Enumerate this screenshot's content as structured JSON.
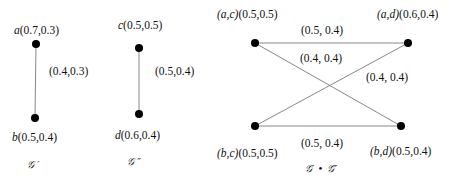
{
  "graphs": [
    {
      "caption": "𝒢 ′",
      "nodes": [
        {
          "id": "a",
          "name": "a",
          "value": "(0.7,0.3)",
          "x": 36,
          "y": 44
        },
        {
          "id": "b",
          "name": "b",
          "value": "(0.5,0.4)",
          "x": 35,
          "y": 118
        }
      ],
      "edges": [
        {
          "from": "a",
          "to": "b",
          "value": "(0.4,0.3)"
        }
      ]
    },
    {
      "caption": "𝒢 ″",
      "nodes": [
        {
          "id": "c",
          "name": "c",
          "value": "(0.5,0.5)",
          "x": 139,
          "y": 48
        },
        {
          "id": "d",
          "name": "d",
          "value": "(0.6,0.4)",
          "x": 139,
          "y": 114
        }
      ],
      "edges": [
        {
          "from": "c",
          "to": "d",
          "value": "(0.5,0.4)"
        }
      ]
    },
    {
      "caption": "𝒢′ • 𝒢″",
      "nodes": [
        {
          "id": "ac",
          "name": "(a,c)",
          "value": "(0.5,0.5)",
          "x": 255,
          "y": 43
        },
        {
          "id": "ad",
          "name": "(a,d)",
          "value": "(0.6,0.4)",
          "x": 408,
          "y": 43
        },
        {
          "id": "bc",
          "name": "(b,c)",
          "value": "(0.5,0.5)",
          "x": 255,
          "y": 126
        },
        {
          "id": "bd",
          "name": "(b,d)",
          "value": "(0.5,0.4)",
          "x": 401,
          "y": 126
        }
      ],
      "edges": [
        {
          "from": "ac",
          "to": "ad",
          "value": "(0.5, 0.4)"
        },
        {
          "from": "ac",
          "to": "bd",
          "value": "(0.4, 0.4)"
        },
        {
          "from": "ad",
          "to": "bc",
          "value": "(0.4, 0.4)"
        },
        {
          "from": "bc",
          "to": "bd",
          "value": "(0.5, 0.4)"
        }
      ]
    }
  ],
  "colors": {
    "edge": "#888888",
    "node": "#000000",
    "text": "#111111"
  }
}
